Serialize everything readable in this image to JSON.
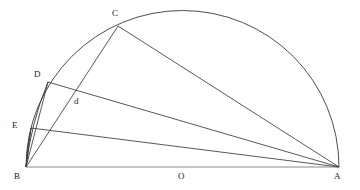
{
  "figure": {
    "type": "geometric-construction",
    "width": 360,
    "height": 190,
    "background_color": "#ffffff",
    "stroke_color": "#3a3a3a",
    "baseline_color": "#8a8a8a"
  },
  "points": {
    "A": {
      "label": "A",
      "x": 339,
      "y": 167,
      "label_x": 336,
      "label_y": 172
    },
    "B": {
      "label": "B",
      "x": 26,
      "y": 167,
      "label_x": 14,
      "label_y": 172
    },
    "C": {
      "label": "C",
      "x": 118,
      "y": 26,
      "label_x": 112,
      "label_y": 9
    },
    "D": {
      "label": "D",
      "x": 48,
      "y": 82,
      "label_x": 34,
      "label_y": 70
    },
    "E": {
      "label": "E",
      "x": 31,
      "y": 128,
      "label_x": 12,
      "label_y": 121
    },
    "O": {
      "label": "O",
      "x": 182,
      "y": 167,
      "label_x": 178,
      "label_y": 172
    },
    "d": {
      "label": "d",
      "x": 72,
      "y": 95,
      "label_x": 74,
      "label_y": 97
    }
  },
  "segments": [
    {
      "name": "diameter-BA",
      "from": "B",
      "to": "A"
    },
    {
      "name": "chord-BC",
      "from": "B",
      "to": "C"
    },
    {
      "name": "chord-CA",
      "from": "C",
      "to": "A"
    },
    {
      "name": "chord-BD",
      "from": "B",
      "to": "D"
    },
    {
      "name": "chord-DA",
      "from": "D",
      "to": "A"
    },
    {
      "name": "chord-BE",
      "from": "B",
      "to": "E"
    },
    {
      "name": "chord-EA",
      "from": "E",
      "to": "A"
    }
  ],
  "arcs": [
    {
      "name": "semicircle-BA",
      "center": "O",
      "radius": 156,
      "from": "B",
      "to": "A",
      "through": "C"
    },
    {
      "name": "arc-B-to-D",
      "center": "A",
      "from": "B",
      "to": "D"
    },
    {
      "name": "arc-B-to-E",
      "center": "A",
      "from": "B",
      "to": "E"
    }
  ],
  "labels": {
    "A": "A",
    "B": "B",
    "C": "C",
    "D": "D",
    "E": "E",
    "O": "O",
    "d": "d"
  }
}
